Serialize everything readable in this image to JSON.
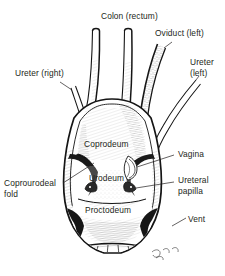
{
  "figure": {
    "background_color": "#ffffff",
    "ink_color": "#231f20",
    "width": 225,
    "height": 276,
    "signature": "artist-signature"
  },
  "labels": {
    "colon_rectum": "Colon (rectum)",
    "oviduct_left": "Oviduct (left)",
    "ureter_left_line1": "Ureter",
    "ureter_left_line2": "(left)",
    "ureter_right": "Ureter (right)",
    "coprodeum": "Coprodeum",
    "vagina": "Vagina",
    "urodeum": "Urodeum",
    "ureteral_papilla_line1": "Ureteral",
    "ureteral_papilla_line2": "papilla",
    "coprourodeal_fold_line1": "Coprourodeal",
    "coprourodeal_fold_line2": "fold",
    "proctodeum": "Proctodeum",
    "vent": "Vent"
  }
}
